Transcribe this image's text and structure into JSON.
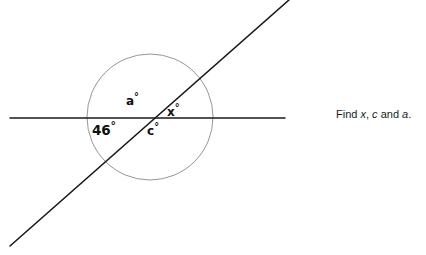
{
  "figure": {
    "background_color": "#ffffff",
    "line_color": "#1a1a1a",
    "circle_color": "#8a8a8a",
    "horizontal_line": {
      "name": "horizontal-line",
      "x1": 10,
      "y1": 118,
      "x2": 285,
      "y2": 118
    },
    "diagonal_line": {
      "name": "diagonal-transversal-line",
      "x1": 10,
      "y1": 246,
      "x2": 289,
      "y2": 0
    },
    "circle": {
      "name": "reference-circle",
      "cx": 150,
      "cy": 117,
      "r": 63
    },
    "intersection_point": {
      "x": 148,
      "y": 118
    }
  },
  "labels": {
    "angle_46": {
      "value": "46",
      "degree": "°"
    },
    "angle_a": {
      "value": "a",
      "degree": "°"
    },
    "angle_x": {
      "value": "x",
      "degree": "°"
    },
    "angle_c": {
      "value": "c",
      "degree": "°"
    }
  },
  "prompt": {
    "lead": "Find ",
    "var1": "x",
    "sep1": ", ",
    "var2": "c",
    "conj": " and ",
    "var3": "a",
    "end": "."
  },
  "chart_data": {
    "type": "diagram",
    "known_angles": [
      {
        "label": "46°",
        "value": 46,
        "position": "below-left of intersection"
      }
    ],
    "unknown_angles": [
      {
        "label": "a°",
        "variable": "a",
        "position": "above-left of intersection"
      },
      {
        "label": "x°",
        "variable": "x",
        "position": "above-right of intersection"
      },
      {
        "label": "c°",
        "variable": "c",
        "position": "below-right of intersection"
      }
    ]
  }
}
